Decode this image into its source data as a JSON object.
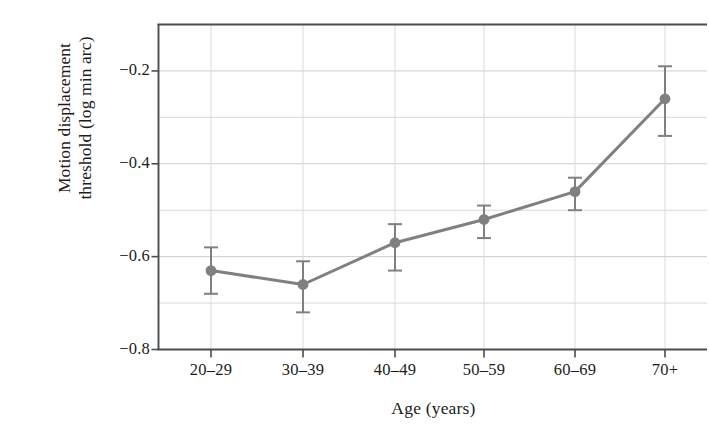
{
  "chart_data": {
    "type": "line",
    "title": "",
    "subtitle": "",
    "xlabel": "Age (years)",
    "ylabel": "Motion displacement\nthreshold (log min arc)",
    "categories": [
      "20–29",
      "30–39",
      "40–49",
      "50–59",
      "60–69",
      "70+"
    ],
    "values": [
      -0.63,
      -0.66,
      -0.57,
      -0.52,
      -0.46,
      -0.26
    ],
    "error_upper": [
      -0.58,
      -0.61,
      -0.53,
      -0.49,
      -0.43,
      -0.19
    ],
    "error_lower": [
      -0.68,
      -0.72,
      -0.63,
      -0.56,
      -0.5,
      -0.34
    ],
    "series": [
      {
        "name": "Motion displacement threshold",
        "values": [
          -0.63,
          -0.66,
          -0.57,
          -0.52,
          -0.46,
          -0.26
        ],
        "error_upper": [
          -0.58,
          -0.61,
          -0.53,
          -0.49,
          -0.43,
          -0.19
        ],
        "error_lower": [
          -0.68,
          -0.72,
          -0.63,
          -0.56,
          -0.5,
          -0.34
        ]
      }
    ],
    "ylim": [
      -0.8,
      -0.1
    ],
    "xlim_categories": 6,
    "ytick_labels": [
      "−0.2",
      "−0.4",
      "−0.6",
      "−0.8"
    ],
    "ytick_values": [
      -0.2,
      -0.4,
      -0.6,
      -0.8
    ],
    "yminor_gridline_values": [
      -0.3,
      -0.5,
      -0.7
    ],
    "grid": true,
    "grid_color": "#cccccc",
    "legend": "none",
    "legend_position": "none",
    "series_color": "#808080",
    "axis_color": "#4d4d4d",
    "marker": "circle",
    "error_bars": "vertical-caps",
    "annotations": []
  },
  "axis_labels": {
    "x_title": "Age (years)",
    "y_title": "Motion displacement\nthreshold (log min arc)"
  }
}
